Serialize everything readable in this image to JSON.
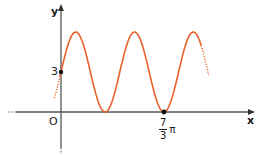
{
  "chart_data": {
    "type": "line",
    "title": "",
    "xlabel": "x",
    "ylabel": "y",
    "function": "y = 3 + 3 sin(3x/2)",
    "series": [
      {
        "name": "f(x)",
        "color": "#e8622c",
        "x_domain_pi": [
          -0.15,
          3.35
        ],
        "points": [
          {
            "x_pi": 0,
            "y": 3,
            "label": "3",
            "marked": true
          },
          {
            "x_pi": 0.333,
            "y": 6
          },
          {
            "x_pi": 1.0,
            "y": 0
          },
          {
            "x_pi": 1.667,
            "y": 6
          },
          {
            "x_pi": 2.333,
            "y": 0,
            "label": "7/3 π",
            "marked": true
          },
          {
            "x_pi": 3.0,
            "y": 6
          }
        ]
      }
    ],
    "x_ticks": [
      {
        "value_pi": 2.333,
        "label": "7/3 π"
      }
    ],
    "y_ticks": [
      {
        "value": 3,
        "label": "3"
      }
    ],
    "origin_label": "O",
    "ylim": [
      -3.2,
      8.3
    ],
    "grid": false,
    "legend": null
  },
  "labels": {
    "y_axis": "y",
    "x_axis": "x",
    "origin": "O",
    "y_tick": "3",
    "x_tick_num": "7",
    "x_tick_den": "3",
    "x_tick_suffix": "π"
  },
  "colors": {
    "curve": "#e8622c",
    "axis": "#555555",
    "text": "#1a1a1a"
  }
}
